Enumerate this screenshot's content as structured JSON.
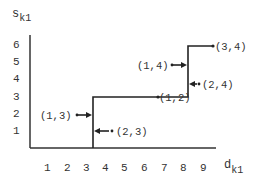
{
  "diagram": {
    "y_axis": {
      "label": "s",
      "label_subscript": "k1",
      "ticks": [
        "1",
        "2",
        "3",
        "4",
        "5",
        "6"
      ]
    },
    "x_axis": {
      "label": "d",
      "label_subscript": "k1",
      "ticks": [
        "1",
        "2",
        "3",
        "4",
        "5",
        "6",
        "7",
        "8",
        "9"
      ]
    },
    "points": [
      {
        "label": "(1,3)",
        "direction": "right",
        "target_step": 1
      },
      {
        "label": "(2,3)",
        "direction": "left",
        "target_step": 1
      },
      {
        "label": "(1,2)",
        "on_step": true
      },
      {
        "label": "(1,4)",
        "direction": "right",
        "target_step": 2
      },
      {
        "label": "(2,4)",
        "direction": "left",
        "target_step": 2
      },
      {
        "label": "(3,4)",
        "on_step": true
      }
    ],
    "step_function": {
      "description": "staircase step function",
      "steps": [
        {
          "x_from": 0,
          "x_to": 3.4,
          "y": 0
        },
        {
          "x_from": 3.4,
          "x_to": 8,
          "y": 3
        },
        {
          "x_from": 8,
          "x_to": 9.5,
          "y": 6
        }
      ]
    }
  }
}
